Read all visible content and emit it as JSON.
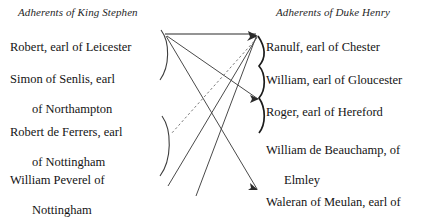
{
  "figure": {
    "headings": {
      "left": "Adherents of King Stephen",
      "right": "Adherents of Duke Henry"
    },
    "left_column": [
      {
        "id": "robert-leicester",
        "line1": "Robert, earl of Leicester",
        "line2": ""
      },
      {
        "id": "simon-northampton",
        "line1": "Simon of Senlis, earl",
        "line2": "of Northampton"
      },
      {
        "id": "robert-ferrers",
        "line1": "Robert de Ferrers, earl",
        "line2": "of Nottingham"
      },
      {
        "id": "william-peverel",
        "line1": "William Peverel of",
        "line2": "Nottingham"
      }
    ],
    "right_column": [
      {
        "id": "ranulf-chester",
        "line1": "Ranulf, earl of Chester",
        "line2": ""
      },
      {
        "id": "william-gloucester",
        "line1": "William, earl of Gloucester",
        "line2": ""
      },
      {
        "id": "roger-hereford",
        "line1": "Roger, earl of Hereford",
        "line2": ""
      },
      {
        "id": "william-beauchamp",
        "line1": "William de Beauchamp, of",
        "line2": "Elmley"
      },
      {
        "id": "waleran-meulan",
        "line1": "Waleran of Meulan, earl of",
        "line2": "Worcester"
      }
    ],
    "colors": {
      "ink": "#1a1a1a",
      "rule": "#6f6f6f",
      "connector": "#4a4a4a",
      "background": "#ffffff"
    }
  }
}
